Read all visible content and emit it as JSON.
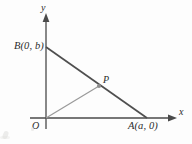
{
  "figure": {
    "kind": "coordinate-geometry-diagram",
    "background_color": "#fdfdfd",
    "axes": {
      "x_axis_label": "x",
      "y_axis_label": "y",
      "origin_label": "O",
      "axis_color": "#4a4a4a",
      "x_axis_y_px": 118,
      "y_axis_x_px": 46,
      "x_axis_start_px": 30,
      "x_axis_end_px": 176,
      "y_axis_top_px": 14,
      "y_axis_bottom_px": 129
    },
    "points": [
      {
        "name": "B",
        "label": "B(0, b)",
        "x_px": 46,
        "y_px": 47,
        "label_position": "left",
        "marked_dot": false
      },
      {
        "name": "A",
        "label": "A(a, 0)",
        "x_px": 146,
        "y_px": 118,
        "label_position": "below-right",
        "marked_dot": false
      },
      {
        "name": "P",
        "label": "P",
        "x_px": 99,
        "y_px": 86,
        "label_position": "above-right",
        "marked_dot": true,
        "dot_color": "#8d8d8d"
      }
    ],
    "segments": [
      {
        "name": "segment-BA",
        "from": "B",
        "to": "A",
        "color": "#4f4f4f",
        "width_px": 1.7
      },
      {
        "name": "segment-OP",
        "from": "O",
        "to": "P",
        "color": "#9a9a9a",
        "width_px": 1.2
      }
    ]
  }
}
